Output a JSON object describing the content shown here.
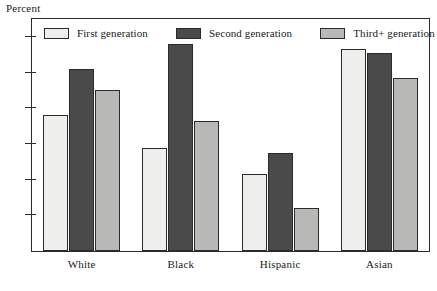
{
  "chart_data": {
    "type": "bar",
    "title": "",
    "subtitle": "",
    "xlabel": "",
    "ylabel": "Percent",
    "ylim": [
      0,
      65
    ],
    "yticks": [
      10,
      20,
      30,
      40,
      50,
      60
    ],
    "ytick_labels": [
      "10",
      "20",
      "30",
      "40",
      "50",
      "60"
    ],
    "grid": false,
    "legend_position": "top-inside",
    "categories": [
      "White",
      "Black",
      "Hispanic",
      "Asian"
    ],
    "series": [
      {
        "name": "First generation",
        "color": "#eeeeec",
        "values": [
          38,
          29,
          21.5,
          56.5
        ]
      },
      {
        "name": "Second generation",
        "color": "#4a4a4a",
        "values": [
          51,
          58,
          27.5,
          55.5
        ]
      },
      {
        "name": "Third+ generation",
        "color": "#b8b8b6",
        "values": [
          45,
          36.5,
          12,
          48.5
        ]
      }
    ]
  },
  "axis": {
    "y_title": "Percent"
  },
  "legend": {
    "entries": [
      {
        "label": "First generation"
      },
      {
        "label": "Second generation"
      },
      {
        "label": "Third+ generation"
      }
    ]
  },
  "colors": {
    "first_generation": "#eeeeec",
    "second_generation": "#4a4a4a",
    "third_plus_generation": "#b8b8b6",
    "outline": "#2b2b2b",
    "background": "#ffffff",
    "text": "#1a1a1a"
  }
}
